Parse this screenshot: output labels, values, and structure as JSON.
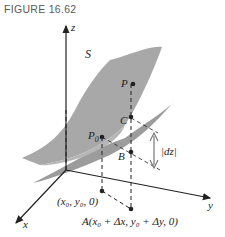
{
  "figure": {
    "title": "FIGURE 16.62"
  },
  "labels": {
    "z_axis": "z",
    "x_axis": "x",
    "y_axis": "y",
    "surface": "S",
    "point_P": "P",
    "point_C": "C",
    "point_P0": "P",
    "point_P0_sub": "0",
    "point_B": "B",
    "dz": "|dz|",
    "base_point": "(x₀, y₀, 0)",
    "point_A": "A(x₀ + Δx, y₀ + Δy, 0)"
  },
  "colors": {
    "surface": "#a6a6a6",
    "tangent_plane": "#9a9a9a",
    "overlap": "#b8b8b8",
    "axis": "#222222"
  }
}
